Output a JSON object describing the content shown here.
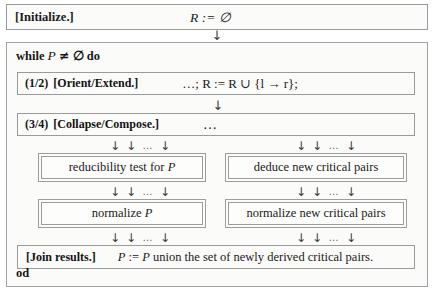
{
  "figure": {
    "kind": "pseudocode-flowchart",
    "initialize": {
      "label": "[Initialize.]",
      "formula_var": "R",
      "formula_assign": ":=",
      "formula_value": "∅",
      "formula_full": "R := ∅"
    },
    "while_loop": {
      "head_keyword_1": "while",
      "head_var": "P",
      "head_relation": "≠",
      "head_value": "∅",
      "head_keyword_2": "do",
      "head_full": "while P ≠ ∅ do",
      "end_keyword": "od"
    },
    "steps": [
      {
        "number": "(1/2)",
        "label": "[Orient/Extend.]",
        "formula": "…; R := R ∪ {l → r};"
      },
      {
        "number": "(3/4)",
        "label": "[Collapse/Compose.]",
        "formula": "…"
      }
    ],
    "arrow_cluster": {
      "arrow": "↓",
      "ellipsis": "…",
      "pattern": "↓ ↓ … ↓"
    },
    "arrow_single": "↓",
    "columns": {
      "left": [
        {
          "text_plain": "reducibility test for P",
          "text_prefix": "reducibility test for",
          "text_var": "P"
        },
        {
          "text_plain": "normalize P",
          "text_prefix": "normalize",
          "text_var": "P"
        }
      ],
      "right": [
        {
          "text_plain": "deduce new critical pairs",
          "text_prefix": "deduce new critical pairs",
          "text_var": ""
        },
        {
          "text_plain": "normalize new critical pairs",
          "text_prefix": "normalize new critical pairs",
          "text_var": ""
        }
      ]
    },
    "join": {
      "label": "[Join results.]",
      "assign_lhs": "P",
      "assign_op": ":=",
      "assign_rhs_var": "P",
      "assign_rhs_text": "union the set of newly derived critical pairs.",
      "full": "P := P union the set of newly derived critical pairs."
    }
  },
  "colors": {
    "background": "#ffffff",
    "box_fill": "#fbfbfa",
    "border": "#9a9a9a",
    "text": "#1a1a1a"
  }
}
